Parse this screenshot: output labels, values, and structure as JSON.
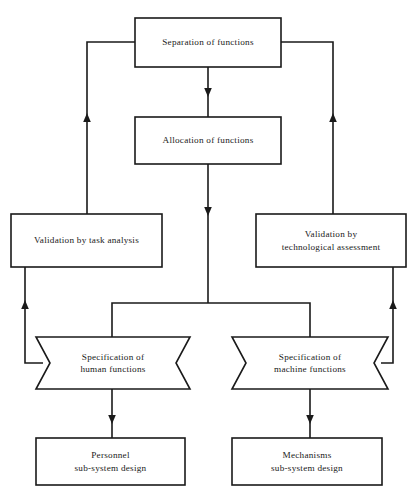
{
  "diagram": {
    "canvas": {
      "width": 416,
      "height": 502
    },
    "style": {
      "background_color": "#ffffff",
      "line_color": "#1a1a1a",
      "text_color": "#1a1a1a"
    },
    "nodes": [
      {
        "id": "separation",
        "shape": "rectangle",
        "label": "Separation of functions",
        "x": 135,
        "y": 18,
        "w": 146,
        "h": 49
      },
      {
        "id": "allocation",
        "shape": "rectangle",
        "label": "Allocation of functions",
        "x": 135,
        "y": 117,
        "w": 146,
        "h": 47
      },
      {
        "id": "validation-task",
        "shape": "rectangle",
        "label": "Validation by task analysis",
        "x": 11,
        "y": 214,
        "w": 151,
        "h": 53
      },
      {
        "id": "validation-tech",
        "shape": "rectangle",
        "label": "Validation by\ntechnological assessment",
        "x": 256,
        "y": 214,
        "w": 150,
        "h": 53
      },
      {
        "id": "spec-human",
        "shape": "banner",
        "label": "Specification of\nhuman functions",
        "x": 36,
        "y": 337,
        "w": 154,
        "h": 52
      },
      {
        "id": "spec-machine",
        "shape": "banner",
        "label": "Specification of\nmachine functions",
        "x": 232,
        "y": 337,
        "w": 156,
        "h": 52
      },
      {
        "id": "personnel",
        "shape": "rectangle",
        "label": "Personnel\nsub-system design",
        "x": 36,
        "y": 438,
        "w": 149,
        "h": 47
      },
      {
        "id": "mechanisms",
        "shape": "rectangle",
        "label": "Mechanisms\nsub-system design",
        "x": 232,
        "y": 438,
        "w": 150,
        "h": 47
      }
    ],
    "edges": [
      {
        "id": "separation-to-allocation",
        "from": "separation",
        "to": "allocation",
        "arrow": "down"
      },
      {
        "id": "allocation-to-branch",
        "from": "allocation",
        "to": "branch-point",
        "arrow": "down"
      },
      {
        "id": "branch-to-spec-human",
        "from": "branch-point",
        "to": "spec-human",
        "arrow": "none"
      },
      {
        "id": "branch-to-spec-machine",
        "from": "branch-point",
        "to": "spec-machine",
        "arrow": "none"
      },
      {
        "id": "spec-human-to-personnel",
        "from": "spec-human",
        "to": "personnel",
        "arrow": "down"
      },
      {
        "id": "spec-machine-to-mechanisms",
        "from": "spec-machine",
        "to": "mechanisms",
        "arrow": "down"
      },
      {
        "id": "spec-human-to-validation-task",
        "from": "spec-human",
        "to": "validation-task",
        "arrow": "up"
      },
      {
        "id": "spec-machine-to-validation-tech",
        "from": "spec-machine",
        "to": "validation-tech",
        "arrow": "up"
      },
      {
        "id": "validation-task-to-separation",
        "from": "validation-task",
        "to": "separation",
        "arrow": "up"
      },
      {
        "id": "validation-tech-to-separation",
        "from": "validation-tech",
        "to": "separation",
        "arrow": "up"
      }
    ]
  }
}
